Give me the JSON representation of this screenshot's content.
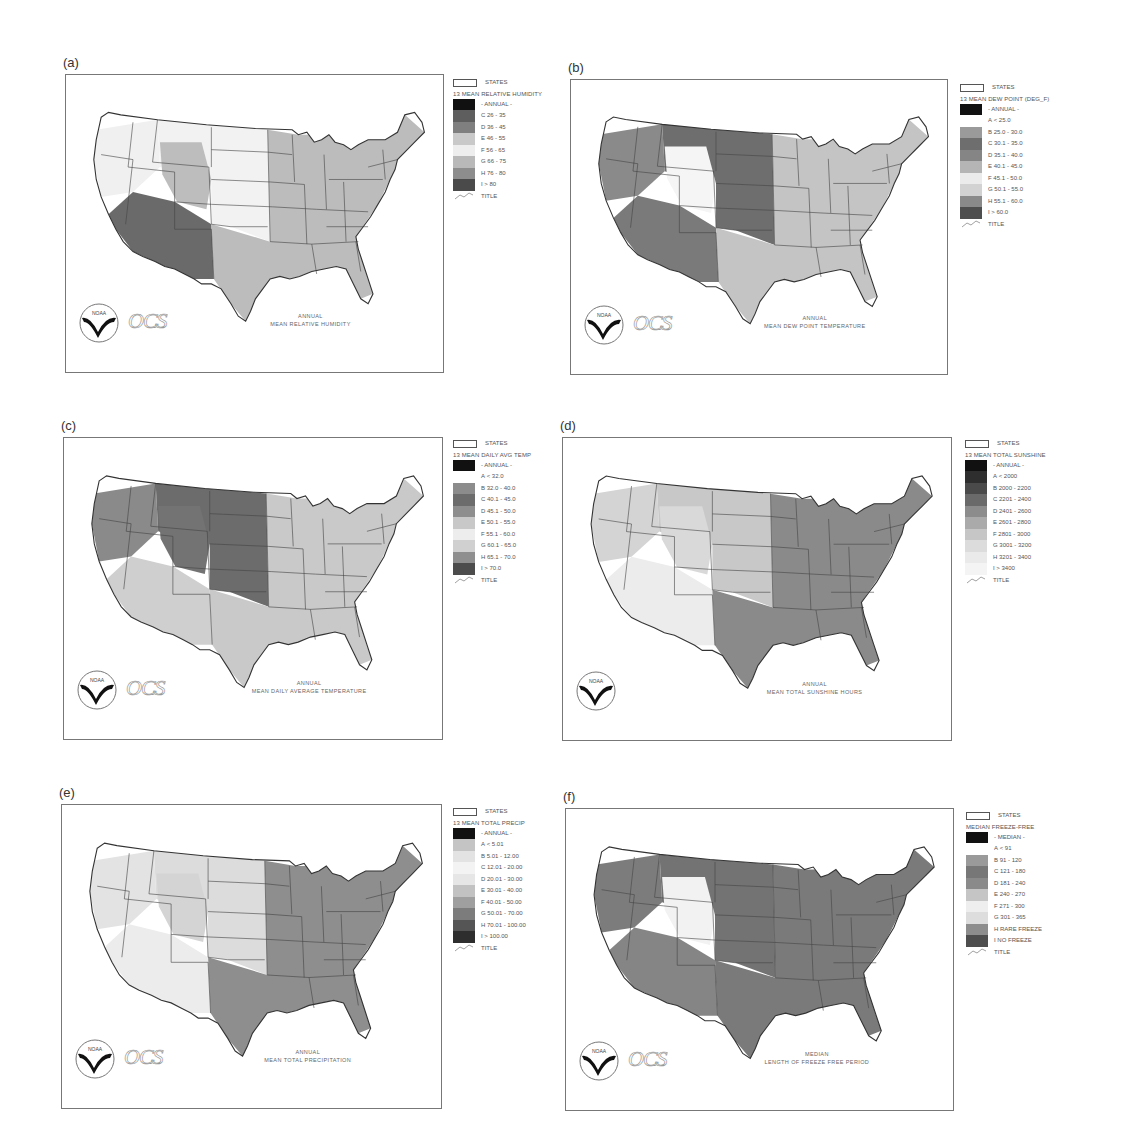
{
  "figure": {
    "panels": [
      {
        "id": "a",
        "label": "(a)",
        "frame": {
          "x": 65,
          "y": 74,
          "w": 379,
          "h": 299
        },
        "legend_pos": {
          "x": 453,
          "y": 77
        },
        "legend": {
          "states_label": "STATES",
          "heading": "13 MEAN RELATIVE HUMIDITY",
          "period_label": "- ANNUAL -",
          "classes": [
            {
              "code": "C",
              "range": "26 - 35",
              "color": "#5e5e5e"
            },
            {
              "code": "D",
              "range": "36 - 45",
              "color": "#7f7f7f"
            },
            {
              "code": "E",
              "range": "46 - 55",
              "color": "#c9c9c9"
            },
            {
              "code": "F",
              "range": "56 - 65",
              "color": "#eeeeee"
            },
            {
              "code": "G",
              "range": "66 - 75",
              "color": "#b9b9b9"
            },
            {
              "code": "H",
              "range": "76 - 80",
              "color": "#8d8d8d"
            },
            {
              "code": "I",
              "range": "> 80",
              "color": "#4a4a4a"
            }
          ],
          "title_label": "TITLE"
        },
        "caption": {
          "line1": "ANNUAL",
          "line2": "MEAN RELATIVE HUMIDITY"
        },
        "logo_text": "NOAA",
        "ocs_text": "OCS",
        "shading": {
          "west": "#f0f0f0",
          "southwest": "#6a6a6a",
          "plains": "#f2f2f2",
          "east": "#bcbcbc",
          "rockies": "#bdbdbd"
        }
      },
      {
        "id": "b",
        "label": "(b)",
        "frame": {
          "x": 570,
          "y": 79,
          "w": 378,
          "h": 296
        },
        "legend_pos": {
          "x": 960,
          "y": 82
        },
        "legend": {
          "states_label": "STATES",
          "heading": "13 MEAN DEW POINT (DEG_F)",
          "period_label": "- ANNUAL -",
          "classes": [
            {
              "code": "A",
              "range": "< 25.0",
              "color": null
            },
            {
              "code": "B",
              "range": "25.0 - 30.0",
              "color": "#9a9a9a"
            },
            {
              "code": "C",
              "range": "30.1 - 35.0",
              "color": "#6e6e6e"
            },
            {
              "code": "D",
              "range": "35.1 - 40.0",
              "color": "#858585"
            },
            {
              "code": "E",
              "range": "40.1 - 45.0",
              "color": "#b5b5b5"
            },
            {
              "code": "F",
              "range": "45.1 - 50.0",
              "color": "#ebebeb"
            },
            {
              "code": "G",
              "range": "50.1 - 55.0",
              "color": "#d2d2d2"
            },
            {
              "code": "H",
              "range": "55.1 - 60.0",
              "color": "#8a8a8a"
            },
            {
              "code": "I",
              "range": "> 60.0",
              "color": "#4e4e4e"
            }
          ],
          "title_label": "TITLE"
        },
        "caption": {
          "line1": "ANNUAL",
          "line2": "MEAN DEW POINT TEMPERATURE"
        },
        "logo_text": "NOAA",
        "ocs_text": "OCS",
        "shading": {
          "west": "#8a8a8a",
          "southwest": "#7a7a7a",
          "plains": "#6e6e6e",
          "east": "#c4c4c4",
          "rockies": "#f5f5f5"
        }
      },
      {
        "id": "c",
        "label": "(c)",
        "frame": {
          "x": 63,
          "y": 437,
          "w": 380,
          "h": 303
        },
        "legend_pos": {
          "x": 453,
          "y": 438
        },
        "legend": {
          "states_label": "STATES",
          "heading": "13 MEAN DAILY AVG TEMP",
          "period_label": "- ANNUAL -",
          "classes": [
            {
              "code": "A",
              "range": "< 32.0",
              "color": null
            },
            {
              "code": "B",
              "range": "32.0 - 40.0",
              "color": "#8c8c8c"
            },
            {
              "code": "C",
              "range": "40.1 - 45.0",
              "color": "#6c6c6c"
            },
            {
              "code": "D",
              "range": "45.1 - 50.0",
              "color": "#8e8e8e"
            },
            {
              "code": "E",
              "range": "50.1 - 55.0",
              "color": "#c8c8c8"
            },
            {
              "code": "F",
              "range": "55.1 - 60.0",
              "color": "#ededed"
            },
            {
              "code": "G",
              "range": "60.1 - 65.0",
              "color": "#d0d0d0"
            },
            {
              "code": "H",
              "range": "65.1 - 70.0",
              "color": "#8f8f8f"
            },
            {
              "code": "I",
              "range": "> 70.0",
              "color": "#4c4c4c"
            }
          ],
          "title_label": "TITLE"
        },
        "caption": {
          "line1": "ANNUAL",
          "line2": "MEAN DAILY AVERAGE TEMPERATURE"
        },
        "logo_text": "NOAA",
        "ocs_text": "OCS",
        "shading": {
          "west": "#8a8a8a",
          "southwest": "#cfcfcf",
          "plains": "#6c6c6c",
          "east": "#c9c9c9",
          "rockies": "#737373"
        }
      },
      {
        "id": "d",
        "label": "(d)",
        "frame": {
          "x": 562,
          "y": 437,
          "w": 390,
          "h": 304
        },
        "legend_pos": {
          "x": 965,
          "y": 438
        },
        "legend": {
          "states_label": "STATES",
          "heading": "13 MEAN TOTAL SUNSHINE",
          "period_label": "- ANNUAL -",
          "classes": [
            {
              "code": "A",
              "range": "< 2000",
              "color": "#2e2e2e"
            },
            {
              "code": "B",
              "range": "2000 - 2200",
              "color": "#4a4a4a"
            },
            {
              "code": "C",
              "range": "2201 - 2400",
              "color": "#6a6a6a"
            },
            {
              "code": "D",
              "range": "2401 - 2600",
              "color": "#8c8c8c"
            },
            {
              "code": "E",
              "range": "2601 - 2800",
              "color": "#aaaaaa"
            },
            {
              "code": "F",
              "range": "2801 - 3000",
              "color": "#c6c6c6"
            },
            {
              "code": "G",
              "range": "3001 - 3200",
              "color": "#dcdcdc"
            },
            {
              "code": "H",
              "range": "3201 - 3400",
              "color": "#eaeaea"
            },
            {
              "code": "I",
              "range": "> 3400",
              "color": "#f4f4f4"
            }
          ],
          "title_label": "TITLE"
        },
        "caption": {
          "line1": "ANNUAL",
          "line2": "MEAN TOTAL SUNSHINE HOURS"
        },
        "logo_text": "NOAA",
        "ocs_text": "",
        "shading": {
          "west": "#d4d4d4",
          "southwest": "#ececec",
          "plains": "#c8c8c8",
          "east": "#8a8a8a",
          "rockies": "#d9d9d9"
        }
      },
      {
        "id": "e",
        "label": "(e)",
        "frame": {
          "x": 61,
          "y": 804,
          "w": 381,
          "h": 305
        },
        "legend_pos": {
          "x": 453,
          "y": 806
        },
        "legend": {
          "states_label": "STATES",
          "heading": "13 MEAN TOTAL PRECIP",
          "period_label": "- ANNUAL -",
          "classes": [
            {
              "code": "A",
              "range": "< 5.01",
              "color": "#c4c4c4"
            },
            {
              "code": "B",
              "range": "5.01 - 12.00",
              "color": "#e3e3e3"
            },
            {
              "code": "C",
              "range": "12.01 - 20.00",
              "color": "#f3f3f3"
            },
            {
              "code": "D",
              "range": "20.01 - 30.00",
              "color": "#e6e6e6"
            },
            {
              "code": "E",
              "range": "30.01 - 40.00",
              "color": "#c2c2c2"
            },
            {
              "code": "F",
              "range": "40.01 - 50.00",
              "color": "#9f9f9f"
            },
            {
              "code": "G",
              "range": "50.01 - 70.00",
              "color": "#7c7c7c"
            },
            {
              "code": "H",
              "range": "70.01 - 100.00",
              "color": "#555555"
            },
            {
              "code": "I",
              "range": "> 100.00",
              "color": "#2e2e2e"
            }
          ],
          "title_label": "TITLE"
        },
        "caption": {
          "line1": "ANNUAL",
          "line2": "MEAN TOTAL PRECIPITATION"
        },
        "logo_text": "NOAA",
        "ocs_text": "OCS",
        "shading": {
          "west": "#e3e3e3",
          "southwest": "#ececec",
          "plains": "#dcdcdc",
          "east": "#8e8e8e",
          "rockies": "#d4d4d4"
        }
      },
      {
        "id": "f",
        "label": "(f)",
        "frame": {
          "x": 565,
          "y": 808,
          "w": 389,
          "h": 303
        },
        "legend_pos": {
          "x": 966,
          "y": 810
        },
        "legend": {
          "states_label": "STATES",
          "heading": "MEDIAN FREEZE-FREE",
          "period_label": "- MEDIAN -",
          "classes": [
            {
              "code": "A",
              "range": "< 91",
              "color": null
            },
            {
              "code": "B",
              "range": "91 - 120",
              "color": "#9a9a9a"
            },
            {
              "code": "C",
              "range": "121 - 180",
              "color": "#777777"
            },
            {
              "code": "D",
              "range": "181 - 240",
              "color": "#8a8a8a"
            },
            {
              "code": "E",
              "range": "240 - 270",
              "color": "#c5c5c5"
            },
            {
              "code": "F",
              "range": "271 - 300",
              "color": "#eeeeee"
            },
            {
              "code": "G",
              "range": "301 - 365",
              "color": "#dddddd"
            },
            {
              "code": "H",
              "range": "RARE FREEZE",
              "color": "#8d8d8d"
            },
            {
              "code": "I",
              "range": "NO FREEZE",
              "color": "#4e4e4e"
            }
          ],
          "title_label": "TITLE"
        },
        "caption": {
          "line1": "MEDIAN",
          "line2": "LENGTH OF FREEZE FREE PERIOD"
        },
        "logo_text": "NOAA",
        "ocs_text": "OCS",
        "shading": {
          "west": "#7c7c7c",
          "southwest": "#858585",
          "plains": "#737373",
          "east": "#7a7a7a",
          "rockies": "#f2f2f2"
        }
      }
    ]
  }
}
